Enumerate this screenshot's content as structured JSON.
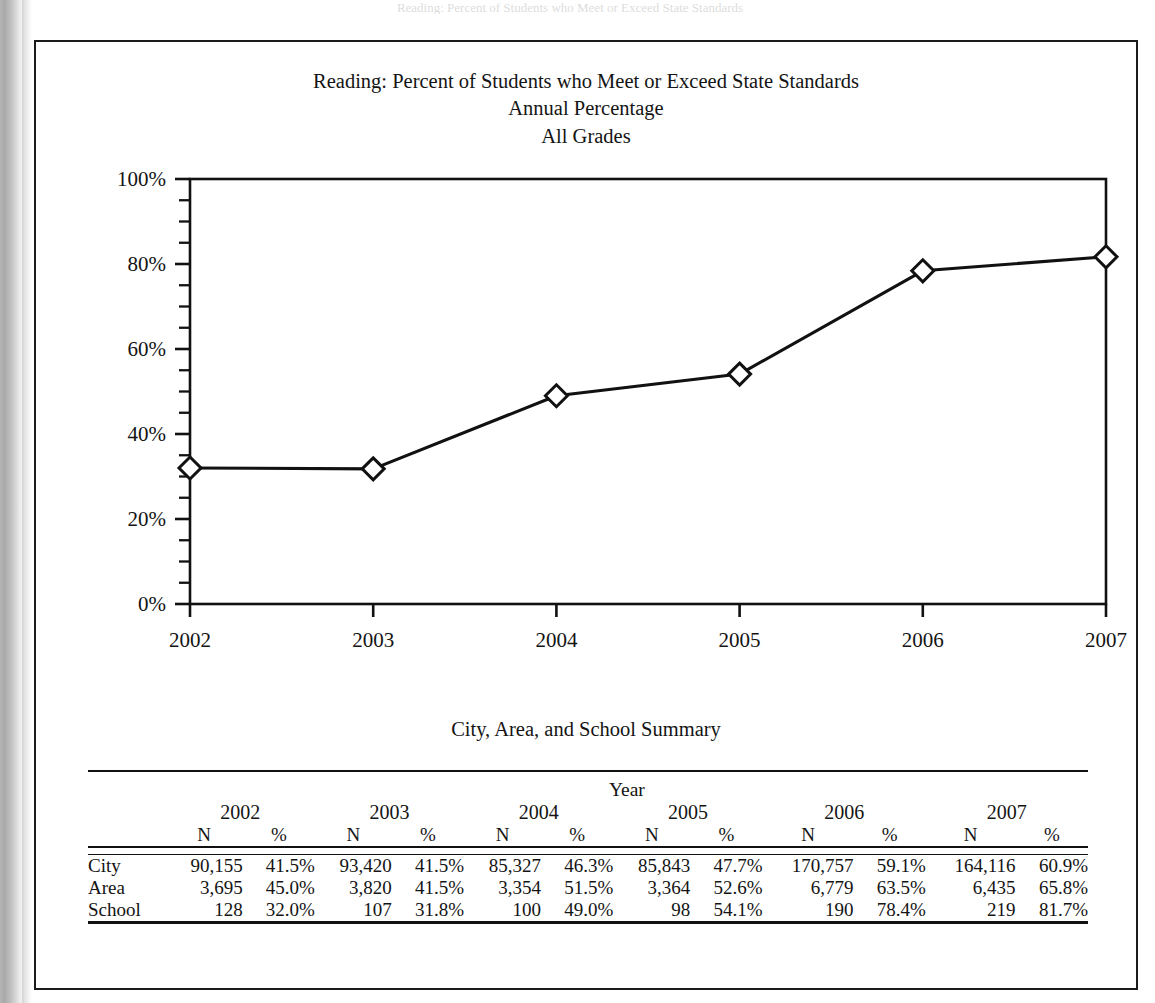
{
  "page": {
    "ghost_text": "Reading: Percent of Students who Meet or Exceed State Standards"
  },
  "figure": {
    "title_line1": "Reading: Percent of Students who Meet or Exceed State Standards",
    "title_line2": "Annual Percentage",
    "title_line3": "All Grades"
  },
  "table": {
    "caption": "City, Area, and School Summary",
    "group_header": "Year",
    "years": [
      "2002",
      "2003",
      "2004",
      "2005",
      "2006",
      "2007"
    ],
    "sub_headers": [
      "N",
      "%"
    ],
    "rows": [
      {
        "label": "City",
        "cells": [
          {
            "n": "90,155",
            "p": "41.5%"
          },
          {
            "n": "93,420",
            "p": "41.5%"
          },
          {
            "n": "85,327",
            "p": "46.3%"
          },
          {
            "n": "85,843",
            "p": "47.7%"
          },
          {
            "n": "170,757",
            "p": "59.1%"
          },
          {
            "n": "164,116",
            "p": "60.9%"
          }
        ]
      },
      {
        "label": "Area",
        "cells": [
          {
            "n": "3,695",
            "p": "45.0%"
          },
          {
            "n": "3,820",
            "p": "41.5%"
          },
          {
            "n": "3,354",
            "p": "51.5%"
          },
          {
            "n": "3,364",
            "p": "52.6%"
          },
          {
            "n": "6,779",
            "p": "63.5%"
          },
          {
            "n": "6,435",
            "p": "65.8%"
          }
        ]
      },
      {
        "label": "School",
        "cells": [
          {
            "n": "128",
            "p": "32.0%"
          },
          {
            "n": "107",
            "p": "31.8%"
          },
          {
            "n": "100",
            "p": "49.0%"
          },
          {
            "n": "98",
            "p": "54.1%"
          },
          {
            "n": "190",
            "p": "78.4%"
          },
          {
            "n": "219",
            "p": "81.7%"
          }
        ]
      }
    ]
  },
  "chart_data": {
    "type": "line",
    "xlabel": "",
    "ylabel": "",
    "x": [
      "2002",
      "2003",
      "2004",
      "2005",
      "2006",
      "2007"
    ],
    "xtick_labels": [
      "2002",
      "2003",
      "2004",
      "2005",
      "2006",
      "2007"
    ],
    "ytick_labels": [
      "0%",
      "20%",
      "40%",
      "60%",
      "80%",
      "100%"
    ],
    "ytick_values": [
      0,
      20,
      40,
      60,
      80,
      100
    ],
    "ylim": [
      0,
      100
    ],
    "y_minor_tick_step": 5,
    "grid": false,
    "legend": false,
    "marker": "open-diamond",
    "line_color": "#111111",
    "marker_fill": "#ffffff",
    "series": [
      {
        "name": "School",
        "values": [
          32.0,
          31.8,
          49.0,
          54.1,
          78.4,
          81.7
        ]
      }
    ]
  }
}
